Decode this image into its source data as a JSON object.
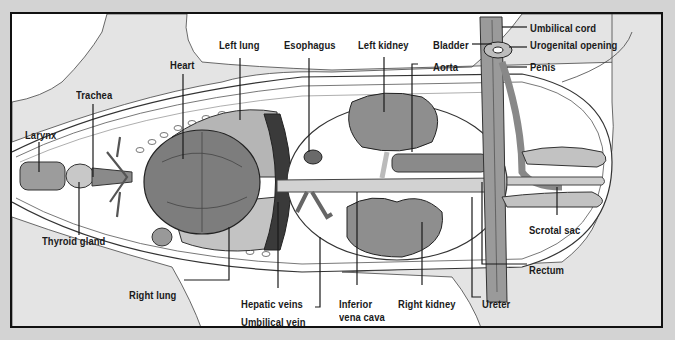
{
  "diagram": {
    "colors": {
      "outer_background": "#d3d3d3",
      "frame_border": "#111111",
      "frame_fill": "#ffffff",
      "body_fill": "#e4e4e4",
      "organ_fill": "#9a9a9a",
      "organ_dark": "#6e6e6e",
      "line": "#222222"
    },
    "labels": {
      "larynx": "Larynx",
      "trachea": "Trachea",
      "heart": "Heart",
      "left_lung": "Left lung",
      "esophagus": "Esophagus",
      "left_kidney": "Left kidney",
      "bladder": "Bladder",
      "aorta": "Aorta",
      "umbilical_cord": "Umbilical cord",
      "urogenital_opening": "Urogenital opening",
      "penis": "Penis",
      "thyroid_gland": "Thyroid gland",
      "right_lung": "Right lung",
      "hepatic_veins": "Hepatic veins",
      "umbilical_vein": "Umbilical vein",
      "inferior_vena_cava_line1": "Inferior",
      "inferior_vena_cava_line2": "vena cava",
      "right_kidney": "Right kidney",
      "ureter": "Ureter",
      "rectum": "Rectum",
      "scrotal_sac": "Scrotal sac"
    }
  }
}
